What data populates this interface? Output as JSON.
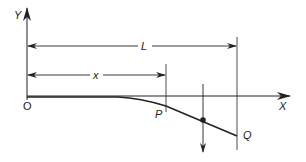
{
  "diagram": {
    "type": "beam deflection diagram",
    "colors": {
      "line": "#222222",
      "background": "#ffffff"
    },
    "axes": {
      "y_label": "Y",
      "x_label": "X",
      "origin_label": "O"
    },
    "dimensions": {
      "total_length_label": "L",
      "position_label": "x"
    },
    "points": {
      "p_label": "P",
      "q_label": "Q"
    },
    "load": {
      "direction": "downward",
      "marker": "dot"
    }
  }
}
